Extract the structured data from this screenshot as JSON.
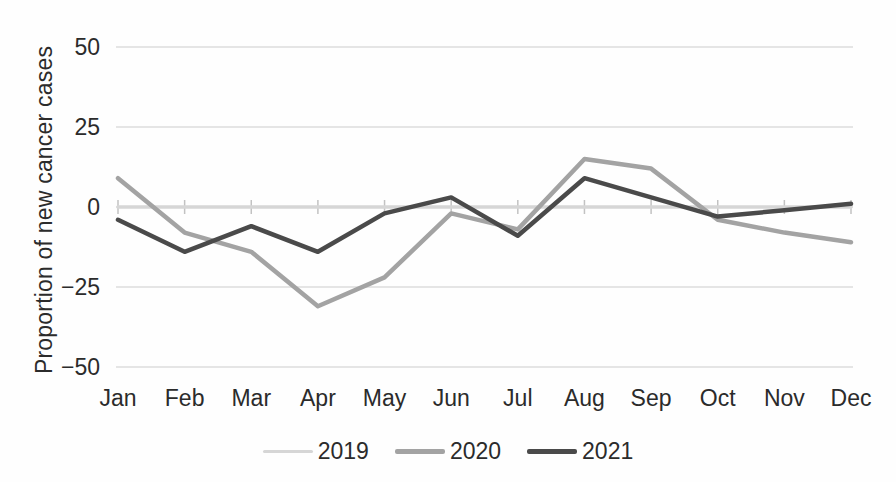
{
  "chart_data": {
    "type": "line",
    "title": "",
    "xlabel": "",
    "ylabel": "Proportion of new cancer cases",
    "categories": [
      "Jan",
      "Feb",
      "Mar",
      "Apr",
      "May",
      "Jun",
      "Jul",
      "Aug",
      "Sep",
      "Oct",
      "Nov",
      "Dec"
    ],
    "series": [
      {
        "name": "2019",
        "color": "#d6d6d6",
        "stroke_width": 3.5,
        "values": [
          0,
          0,
          0,
          0,
          0,
          0,
          0,
          0,
          0,
          0,
          0,
          0
        ]
      },
      {
        "name": "2020",
        "color": "#a3a3a3",
        "stroke_width": 4.5,
        "values": [
          9,
          -8,
          -14,
          -31,
          -22,
          -2,
          -7,
          15,
          12,
          -4,
          -8,
          -11
        ]
      },
      {
        "name": "2021",
        "color": "#4a4a4a",
        "stroke_width": 4.5,
        "values": [
          -4,
          -14,
          -6,
          -14,
          -2,
          3,
          -9,
          9,
          3,
          -3,
          -1,
          1
        ]
      }
    ],
    "ytick_values": [
      50,
      25,
      0,
      -25,
      -50
    ],
    "ytick_labels": [
      "50",
      "25",
      "0",
      "−25",
      "−50"
    ],
    "ylim": [
      -50,
      50
    ],
    "grid": true,
    "legend_position": "bottom",
    "colors": {
      "gridline": "#dcdcdc",
      "axis_tick": "#c2c2c2",
      "text": "#2b2b2b"
    }
  }
}
